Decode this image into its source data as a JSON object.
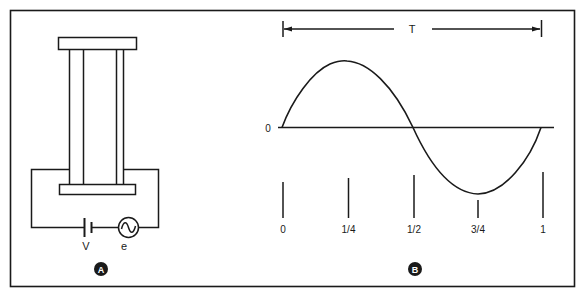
{
  "figure": {
    "panels": [
      {
        "id": "A",
        "badge_label": "A",
        "description": "Piezoelectric/vibrating column between two plates driven by DC bias and AC source",
        "components": {
          "battery_label": "V",
          "ac_source_label": "e",
          "ac_source_symbol": "~"
        }
      },
      {
        "id": "B",
        "badge_label": "B",
        "description": "One period of a sine wave",
        "period_label": "T",
        "zero_label": "0",
        "ticks": [
          "0",
          "1/4",
          "1/2",
          "3/4",
          "1"
        ]
      }
    ]
  },
  "colors": {
    "ink": "#1a1a1a",
    "background": "#ffffff"
  }
}
